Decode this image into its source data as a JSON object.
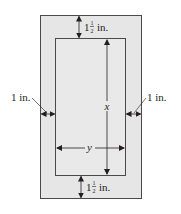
{
  "diagram": {
    "type": "poster-with-margins",
    "colors": {
      "outer_fill": "#e6e6e6",
      "inner_fill": "#e9e9e9",
      "stroke": "#4a4a4a",
      "text": "#231f20"
    },
    "labels": {
      "top_margin": {
        "whole": "1",
        "num": "1",
        "den": "2",
        "unit": "in."
      },
      "bottom_margin": {
        "whole": "1",
        "num": "1",
        "den": "2",
        "unit": "in."
      },
      "left_margin": "1 in.",
      "right_margin": "1 in.",
      "height_var": "x",
      "width_var": "y"
    }
  }
}
